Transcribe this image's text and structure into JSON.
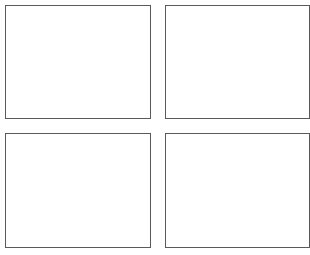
{
  "panels": [
    {
      "id": "top-left",
      "x": 5,
      "y": 5,
      "w": 146,
      "h": 114
    },
    {
      "id": "top-right",
      "x": 165,
      "y": 5,
      "w": 145,
      "h": 114
    },
    {
      "id": "bottom-left",
      "x": 5,
      "y": 133,
      "w": 146,
      "h": 115
    },
    {
      "id": "bottom-right",
      "x": 165,
      "y": 133,
      "w": 145,
      "h": 115
    }
  ],
  "colors": {
    "border": "#5a5a5a",
    "background": "#ffffff"
  }
}
